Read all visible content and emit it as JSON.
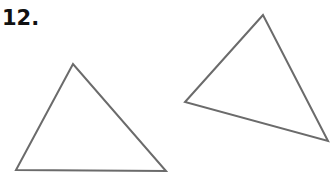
{
  "problem": {
    "number_label": "12."
  },
  "figure": {
    "stroke_color": "#6b6b6b",
    "stroke_width": 2,
    "triangles": [
      {
        "name": "left-triangle",
        "points": "73,64 16,170 166,171"
      },
      {
        "name": "right-triangle",
        "points": "263,15 185,102 328,141"
      }
    ]
  }
}
